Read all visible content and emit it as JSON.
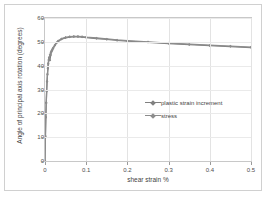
{
  "chart_data": {
    "type": "line",
    "title": "",
    "xlabel": "shear strain %",
    "ylabel": "Angle of principal axis rotation (degrees)",
    "xlim": [
      0,
      0.5
    ],
    "ylim": [
      0,
      60
    ],
    "xticks": [
      "0",
      "0.1",
      "0.2",
      "0.3",
      "0.4",
      "0.5"
    ],
    "xtick_values": [
      0,
      0.1,
      0.2,
      0.3,
      0.4,
      0.5
    ],
    "yticks": [
      "0",
      "10",
      "20",
      "30",
      "40",
      "50",
      "60"
    ],
    "ytick_values": [
      0,
      10,
      20,
      30,
      40,
      50,
      60
    ],
    "grid": true,
    "grid_axes": "both",
    "legend_position": "center-right",
    "series": [
      {
        "name": "plastic strain increment",
        "color": "#808080",
        "marker": "diamond",
        "x": [
          0,
          0.001,
          0.002,
          0.003,
          0.004,
          0.005,
          0.006,
          0.007,
          0.008,
          0.009,
          0.01,
          0.012,
          0.014,
          0.016,
          0.018,
          0.02,
          0.024,
          0.028,
          0.032,
          0.04,
          0.05,
          0.06,
          0.07,
          0.08,
          0.09,
          0.1,
          0.125,
          0.15,
          0.175,
          0.2,
          0.25,
          0.3,
          0.35,
          0.4,
          0.45,
          0.5
        ],
        "y": [
          0,
          10.5,
          18.5,
          24.5,
          29.5,
          33.5,
          36.5,
          39,
          41,
          42.5,
          43.5,
          42.3,
          44.5,
          45.8,
          46.6,
          47.3,
          48.5,
          49.5,
          50.2,
          51.1,
          51.7,
          52,
          52.1,
          52.1,
          52,
          51.8,
          51.4,
          51.0,
          50.6,
          50.3,
          49.8,
          49.3,
          48.8,
          48.4,
          48.0,
          47.6
        ]
      },
      {
        "name": "stress",
        "color": "#8c8c8c",
        "marker": "diamond",
        "x": [
          0,
          0.001,
          0.002,
          0.003,
          0.004,
          0.005,
          0.006,
          0.007,
          0.008,
          0.009,
          0.01,
          0.012,
          0.014,
          0.016,
          0.018,
          0.02,
          0.024,
          0.028,
          0.032,
          0.04,
          0.05,
          0.06,
          0.07,
          0.08,
          0.09,
          0.1,
          0.125,
          0.15,
          0.175,
          0.2,
          0.25,
          0.3,
          0.35,
          0.4,
          0.45,
          0.5
        ],
        "y": [
          0,
          10.3,
          18.2,
          24.2,
          29.2,
          33.2,
          36.2,
          38.7,
          40.7,
          42.2,
          43.2,
          44.6,
          45.6,
          46.4,
          47.0,
          47.6,
          48.7,
          49.7,
          50.4,
          51.3,
          51.9,
          52.2,
          52.3,
          52.3,
          52.2,
          52.0,
          51.6,
          51.2,
          50.8,
          50.5,
          50.0,
          49.5,
          49.0,
          48.6,
          48.2,
          47.8
        ]
      }
    ]
  },
  "legend": {
    "entries": [
      {
        "label": "plastic strain increment"
      },
      {
        "label": "stress"
      }
    ]
  },
  "colors": {
    "series_primary": "#808080",
    "series_secondary": "#8c8c8c",
    "grid": "#e3e3e3",
    "axis": "#9a9a9a",
    "frame": "#c8c8c8",
    "outer_border": "#d0d0d0",
    "text": "#3f3f3f"
  }
}
